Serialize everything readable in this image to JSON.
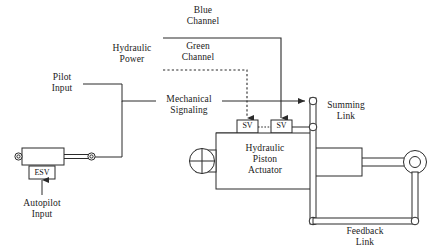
{
  "diagram": {
    "stroke_color": "#2b2b2b",
    "text_color": "#1a1a1a",
    "background": "#ffffff"
  },
  "labels": {
    "blue_channel": {
      "line1": "Blue",
      "line2": "Channel"
    },
    "green_channel": {
      "line1": "Green",
      "line2": "Channel"
    },
    "hydraulic_power": {
      "line1": "Hydraulic",
      "line2": "Power"
    },
    "mechanical_signaling": {
      "line1": "Mechanical",
      "line2": "Signaling"
    },
    "pilot_input": {
      "line1": "Pilot",
      "line2": "Input"
    },
    "autopilot_input": {
      "line1": "Autopilot",
      "line2": "Input"
    },
    "summing_link": {
      "line1": "Summing",
      "line2": "Link"
    },
    "feedback_link": {
      "line1": "Feedback",
      "line2": "Link"
    },
    "actuator": {
      "line1": "Hydraulic",
      "line2": "Piston",
      "line3": "Actuator"
    },
    "esv": "ESV",
    "sv_left": "SV",
    "sv_right": "SV"
  }
}
